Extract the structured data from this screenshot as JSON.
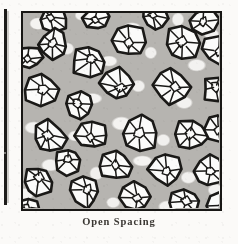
{
  "figure": {
    "caption": "Open Spacing",
    "panel": {
      "label": "micrograph-panel",
      "border_color": "#181715",
      "matrix_color": "#b6b4b0",
      "mottle_color": "#f3f2f0",
      "cluster_fill": "#fbfbfa",
      "cluster_outline": "#1a1917",
      "x": 21,
      "y": 11,
      "width": 201,
      "height": 200
    },
    "neighbor_panel_edge": {
      "label": "adjacent-figure-edge",
      "x": 4,
      "y": 9,
      "width": 3,
      "height": 196,
      "color": "#1d1c1a"
    }
  },
  "chart_data": {
    "type": "scatter",
    "title": "Open Spacing",
    "subtitle": "",
    "xlabel": "",
    "ylabel": "",
    "xlim": [
      0,
      201
    ],
    "ylim": [
      0,
      200
    ],
    "grid": false,
    "legend": null,
    "units": "panel pixels",
    "series": [
      {
        "name": "aggregate-clusters",
        "marker": "irregular-polygon-cluster",
        "fill": "#fbfbfa",
        "edge": "#1a1917",
        "count": 30,
        "points": [
          {
            "id": 1,
            "x": 30,
            "y": 6,
            "r": 15,
            "seed": 11,
            "facets": 6
          },
          {
            "id": 2,
            "x": 74,
            "y": 5,
            "r": 14,
            "seed": 23,
            "facets": 5
          },
          {
            "id": 3,
            "x": 131,
            "y": 4,
            "r": 13,
            "seed": 37,
            "facets": 6
          },
          {
            "id": 4,
            "x": 181,
            "y": 7,
            "r": 14,
            "seed": 41,
            "facets": 5
          },
          {
            "id": 5,
            "x": 30,
            "y": 32,
            "r": 17,
            "seed": 53,
            "facets": 7
          },
          {
            "id": 6,
            "x": 106,
            "y": 28,
            "r": 17,
            "seed": 67,
            "facets": 6
          },
          {
            "id": 7,
            "x": 159,
            "y": 31,
            "r": 18,
            "seed": 71,
            "facets": 7
          },
          {
            "id": 8,
            "x": 195,
            "y": 36,
            "r": 15,
            "seed": 83,
            "facets": 5
          },
          {
            "id": 9,
            "x": 66,
            "y": 48,
            "r": 18,
            "seed": 97,
            "facets": 7
          },
          {
            "id": 10,
            "x": 18,
            "y": 76,
            "r": 17,
            "seed": 103,
            "facets": 6
          },
          {
            "id": 11,
            "x": 95,
            "y": 72,
            "r": 18,
            "seed": 109,
            "facets": 7
          },
          {
            "id": 12,
            "x": 148,
            "y": 73,
            "r": 18,
            "seed": 127,
            "facets": 7
          },
          {
            "id": 13,
            "x": 196,
            "y": 76,
            "r": 16,
            "seed": 131,
            "facets": 6
          },
          {
            "id": 14,
            "x": 57,
            "y": 92,
            "r": 16,
            "seed": 139,
            "facets": 6
          },
          {
            "id": 15,
            "x": 27,
            "y": 125,
            "r": 18,
            "seed": 149,
            "facets": 7
          },
          {
            "id": 16,
            "x": 70,
            "y": 121,
            "r": 17,
            "seed": 151,
            "facets": 6
          },
          {
            "id": 17,
            "x": 118,
            "y": 120,
            "r": 19,
            "seed": 163,
            "facets": 7
          },
          {
            "id": 18,
            "x": 168,
            "y": 122,
            "r": 18,
            "seed": 173,
            "facets": 7
          },
          {
            "id": 19,
            "x": 196,
            "y": 116,
            "r": 15,
            "seed": 179,
            "facets": 6
          },
          {
            "id": 20,
            "x": 45,
            "y": 148,
            "r": 14,
            "seed": 191,
            "facets": 5
          },
          {
            "id": 21,
            "x": 92,
            "y": 152,
            "r": 16,
            "seed": 197,
            "facets": 6
          },
          {
            "id": 22,
            "x": 143,
            "y": 155,
            "r": 17,
            "seed": 211,
            "facets": 6
          },
          {
            "id": 23,
            "x": 186,
            "y": 158,
            "r": 16,
            "seed": 223,
            "facets": 6
          },
          {
            "id": 24,
            "x": 14,
            "y": 168,
            "r": 16,
            "seed": 227,
            "facets": 6
          },
          {
            "id": 25,
            "x": 62,
            "y": 178,
            "r": 17,
            "seed": 233,
            "facets": 6
          },
          {
            "id": 26,
            "x": 112,
            "y": 184,
            "r": 16,
            "seed": 239,
            "facets": 6
          },
          {
            "id": 27,
            "x": 160,
            "y": 190,
            "r": 16,
            "seed": 251,
            "facets": 6
          },
          {
            "id": 28,
            "x": 197,
            "y": 192,
            "r": 14,
            "seed": 257,
            "facets": 5
          },
          {
            "id": 29,
            "x": 7,
            "y": 44,
            "r": 13,
            "seed": 263,
            "facets": 5
          },
          {
            "id": 30,
            "x": 6,
            "y": 196,
            "r": 12,
            "seed": 269,
            "facets": 5
          }
        ]
      }
    ]
  }
}
